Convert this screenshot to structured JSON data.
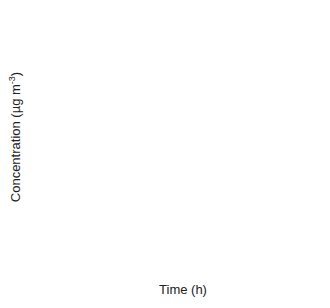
{
  "chart_data": {
    "type": "line",
    "title": "",
    "xlabel": "Time (h)",
    "ylabel": "Concentration (µg m⁻³)",
    "xlim": [
      0,
      10
    ],
    "ylim": [
      0,
      10
    ],
    "x_ticks": [
      0,
      2,
      4,
      6,
      8,
      10
    ],
    "y_ticks": [
      0,
      2,
      4,
      6,
      8,
      10
    ],
    "grid": false,
    "legend": "none (inline annotations with arrows)",
    "series": [
      {
        "name": "Case 1 (Cw,i)",
        "style": "dotted",
        "model": "10*(1-exp(-0.27t))",
        "x": [
          0,
          1,
          2,
          3,
          4,
          5,
          6,
          7,
          8,
          9,
          10
        ],
        "values": [
          0,
          2.37,
          4.17,
          5.55,
          6.6,
          7.41,
          8.02,
          8.49,
          8.85,
          9.12,
          9.33
        ]
      },
      {
        "name": "Case 1 (Cg,i)",
        "style": "dashed",
        "model": "10*exp(-0.27t)",
        "x": [
          0,
          1,
          2,
          3,
          4,
          5,
          6,
          7,
          8,
          9,
          10
        ],
        "values": [
          10,
          7.63,
          5.83,
          4.45,
          3.4,
          2.59,
          1.98,
          1.51,
          1.15,
          0.88,
          0.67
        ]
      },
      {
        "name": "Case 2 (Cw,i)",
        "style": "solid",
        "model": "9.85*(1-exp(-3.3t))",
        "x": [
          0,
          0.25,
          0.5,
          0.75,
          1,
          1.5,
          2,
          4,
          6,
          8,
          10
        ],
        "values": [
          0,
          5.5,
          7.9,
          9.0,
          9.5,
          9.78,
          9.84,
          9.85,
          9.85,
          9.85,
          9.85
        ]
      },
      {
        "name": "Case 2 (Cg,i)",
        "style": "solid",
        "model": "0.15+9.85*exp(-3.3t)",
        "x": [
          0,
          0.25,
          0.5,
          0.75,
          1,
          1.5,
          2,
          4,
          6,
          8,
          10
        ],
        "values": [
          10,
          4.5,
          2.1,
          0.98,
          0.5,
          0.22,
          0.16,
          0.15,
          0.15,
          0.15,
          0.15
        ]
      }
    ],
    "annotations": [
      {
        "text": "Case 2 (C",
        "sub": "w,i",
        "close": ")",
        "x": 1.7,
        "y": 9.0
      },
      {
        "text": "Case 1 (C",
        "sub": "w,i",
        "close": ")",
        "x": 5.6,
        "y": 6.4
      },
      {
        "text": "Case 1 (C",
        "sub": "g,i",
        "close": ")",
        "x": 5.2,
        "y": 3.7
      },
      {
        "text": "Case 2 (C",
        "sub": "g,i",
        "close": ")",
        "x": 1.8,
        "y": 0.9
      }
    ]
  }
}
